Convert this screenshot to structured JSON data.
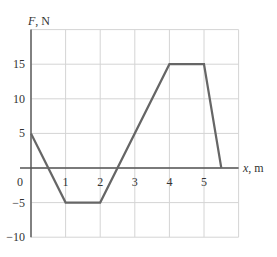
{
  "chart_data": {
    "type": "line",
    "title": "",
    "xlabel": "x, m",
    "ylabel": "F, N",
    "xlabel_var": "x",
    "xlabel_unit": ", m",
    "ylabel_var": "F",
    "ylabel_unit": ", N",
    "x": [
      0,
      1,
      2,
      4,
      5,
      5.5
    ],
    "series": [
      {
        "name": "F(x)",
        "values": [
          5,
          -5,
          -5,
          15,
          15,
          0
        ]
      }
    ],
    "xlim": [
      0,
      6
    ],
    "ylim": [
      -10,
      20
    ],
    "x_ticks": [
      1,
      2,
      3,
      4,
      5
    ],
    "x_tick_labels": [
      "1",
      "2",
      "3",
      "4",
      "5"
    ],
    "y_ticks": [
      15,
      10,
      5,
      -5,
      -10
    ],
    "y_tick_labels": [
      "15",
      "10",
      "5",
      "−5",
      "−10"
    ],
    "origin_label": "0",
    "grid": true,
    "x_grid_step": 1,
    "y_grid_step": 5,
    "legend": null,
    "colors": {
      "line": "#666666",
      "grid": "#d4d4d4",
      "axis": "#555555",
      "text": "#333333"
    }
  }
}
